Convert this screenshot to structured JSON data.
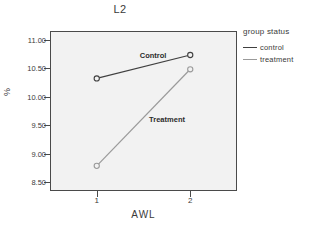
{
  "chart_data": {
    "type": "line",
    "title": "L2",
    "xlabel": "AWL",
    "ylabel": "%",
    "x": [
      1,
      2
    ],
    "xticklabels": [
      "1",
      "2"
    ],
    "yticklabels": [
      "11.00",
      "10.50",
      "10.00",
      "9.50",
      "9.00",
      "8.50"
    ],
    "ytickvalues": [
      11.0,
      10.5,
      10.0,
      9.5,
      9.0,
      8.5
    ],
    "ylim": [
      8.35,
      11.15
    ],
    "xlim": [
      0.5,
      2.5
    ],
    "grid": false,
    "legend_position": "right",
    "legend_title": "group status",
    "markers": "open-circle",
    "series": [
      {
        "name": "control",
        "label": "Control",
        "color": "#404040",
        "values": [
          10.32,
          10.73
        ]
      },
      {
        "name": "treatment",
        "label": "Treatment",
        "color": "#9a9a9a",
        "values": [
          8.79,
          10.48
        ]
      }
    ],
    "annotations": [
      {
        "text": "Control",
        "x": 1.46,
        "y": 10.72
      },
      {
        "text": "Treatment",
        "x": 1.56,
        "y": 9.59
      }
    ]
  },
  "legend": {
    "title": "group status",
    "entries": [
      {
        "label": "control",
        "color": "#404040"
      },
      {
        "label": "treatment",
        "color": "#9a9a9a"
      }
    ]
  },
  "colors": {
    "plot_background": "#f2f2f2",
    "frame": "#4a4a4a",
    "control": "#404040",
    "treatment": "#9a9a9a",
    "text": "#3a3a3a"
  }
}
